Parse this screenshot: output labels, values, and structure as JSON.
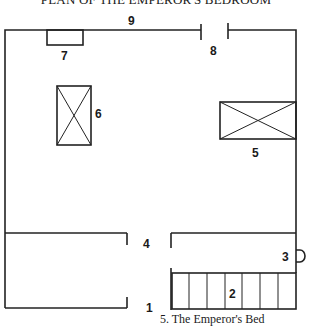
{
  "title": "PLAN OF THE EMPEROR'S BEDROOM",
  "labels": {
    "l1": "1",
    "l2": "2",
    "l3": "3",
    "l4": "4",
    "l5": "5",
    "l6": "6",
    "l7": "7",
    "l8": "8",
    "l9": "9"
  },
  "legend": [
    {
      "number": "5",
      "text": "5. The Emperor's Bed"
    }
  ],
  "colors": {
    "ink": "#222222",
    "paper": "#ffffff"
  }
}
